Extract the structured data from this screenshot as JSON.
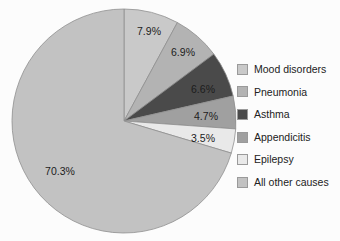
{
  "chart_data": {
    "type": "pie",
    "title": "",
    "subtitle": "",
    "xlabel": "",
    "ylabel": "",
    "legend_position": "right",
    "grid": false,
    "start_angle_deg": 0,
    "direction": "clockwise",
    "categories": [
      "Mood disorders",
      "Pneumonia",
      "Asthma",
      "Appendicitis",
      "Epilepsy",
      "All other causes"
    ],
    "values": [
      7.9,
      6.9,
      6.6,
      4.7,
      3.5,
      70.3
    ],
    "value_labels": [
      "7.9%",
      "6.9%",
      "6.6%",
      "4.7%",
      "3.5%",
      "70.3%"
    ],
    "unit": "%",
    "colors": [
      "#c9c9c9",
      "#b3b3b3",
      "#4a4a4a",
      "#a0a0a0",
      "#e9e9e9",
      "#c2c2c2"
    ],
    "slices": [
      {
        "label": "Mood disorders",
        "value": 7.9,
        "value_label": "7.9%",
        "color": "#c9c9c9",
        "label_x": 149,
        "label_y": 32
      },
      {
        "label": "Pneumonia",
        "value": 6.9,
        "value_label": "6.9%",
        "color": "#b3b3b3",
        "label_x": 183,
        "label_y": 53
      },
      {
        "label": "Asthma",
        "value": 6.6,
        "value_label": "6.6%",
        "color": "#4a4a4a",
        "label_x": 203,
        "label_y": 90
      },
      {
        "label": "Appendicitis",
        "value": 4.7,
        "value_label": "4.7%",
        "color": "#a0a0a0",
        "label_x": 206,
        "label_y": 117
      },
      {
        "label": "Epilepsy",
        "value": 3.5,
        "value_label": "3.5%",
        "color": "#e9e9e9",
        "label_x": 203,
        "label_y": 139
      },
      {
        "label": "All other causes",
        "value": 70.3,
        "value_label": "70.3%",
        "color": "#c2c2c2",
        "label_x": 60,
        "label_y": 172
      }
    ],
    "geometry": {
      "center_x": 124,
      "center_y": 121,
      "radius": 112,
      "stroke": "#8f8f8f"
    }
  },
  "legend": {
    "items": [
      {
        "label": "Mood disorders",
        "color": "#c9c9c9"
      },
      {
        "label": "Pneumonia",
        "color": "#b3b3b3"
      },
      {
        "label": "Asthma",
        "color": "#4a4a4a"
      },
      {
        "label": "Appendicitis",
        "color": "#a0a0a0"
      },
      {
        "label": "Epilepsy",
        "color": "#e9e9e9"
      },
      {
        "label": "All other causes",
        "color": "#c2c2c2"
      }
    ]
  },
  "background_color": "#fcfcfc"
}
